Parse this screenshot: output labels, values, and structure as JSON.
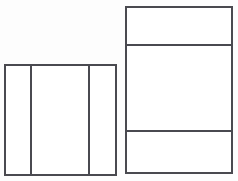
{
  "figure": {
    "background_color": "#fdfdfd",
    "line_color": "#4a4a50",
    "fill_color": "#ffffff",
    "line_width": 2,
    "canvas_width": 238,
    "canvas_height": 181
  },
  "shapes": [
    {
      "name": "left-rectangle",
      "label": "Left rectangle",
      "x": 5,
      "y": 65,
      "width": 111,
      "height": 110,
      "partition_direction": "vertical",
      "part_count": 3,
      "dividers": [
        {
          "name": "left-rectangle-divider-1",
          "label": "Vertical divider 1",
          "position": 31
        },
        {
          "name": "left-rectangle-divider-2",
          "label": "Vertical divider 2",
          "position": 89
        }
      ],
      "cells": [
        {
          "name": "left-rectangle-cell-1",
          "label": "Left column",
          "x": 5,
          "y": 65,
          "width": 26,
          "height": 110
        },
        {
          "name": "left-rectangle-cell-2",
          "label": "Middle column",
          "x": 31,
          "y": 65,
          "width": 58,
          "height": 110
        },
        {
          "name": "left-rectangle-cell-3",
          "label": "Right column",
          "x": 89,
          "y": 65,
          "width": 27,
          "height": 110
        }
      ]
    },
    {
      "name": "right-rectangle",
      "label": "Right rectangle",
      "x": 126,
      "y": 7,
      "width": 106,
      "height": 166,
      "partition_direction": "horizontal",
      "part_count": 3,
      "dividers": [
        {
          "name": "right-rectangle-divider-1",
          "label": "Horizontal divider 1",
          "position": 45
        },
        {
          "name": "right-rectangle-divider-2",
          "label": "Horizontal divider 2",
          "position": 131
        }
      ],
      "cells": [
        {
          "name": "right-rectangle-cell-1",
          "label": "Top row",
          "x": 126,
          "y": 7,
          "width": 106,
          "height": 38
        },
        {
          "name": "right-rectangle-cell-2",
          "label": "Middle row",
          "x": 126,
          "y": 45,
          "width": 106,
          "height": 86
        },
        {
          "name": "right-rectangle-cell-3",
          "label": "Bottom row",
          "x": 126,
          "y": 131,
          "width": 106,
          "height": 42
        }
      ]
    }
  ]
}
